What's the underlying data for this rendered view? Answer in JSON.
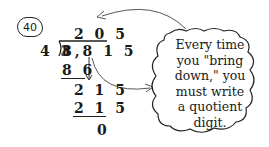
{
  "problem_number": "40",
  "division": {
    "quotient": "2 0 5",
    "divisor": "4 3",
    "dividend": "8,8 1 5",
    "steps": [
      {
        "subtract": "8 6"
      },
      {
        "bring_down_result": "2 1 5"
      },
      {
        "subtract": "2 1 5"
      },
      {
        "remainder": "0"
      }
    ]
  },
  "callout": {
    "lines": [
      "Every time",
      "you \"bring",
      "down,\" you",
      "must write",
      "a quotient",
      "digit."
    ]
  }
}
